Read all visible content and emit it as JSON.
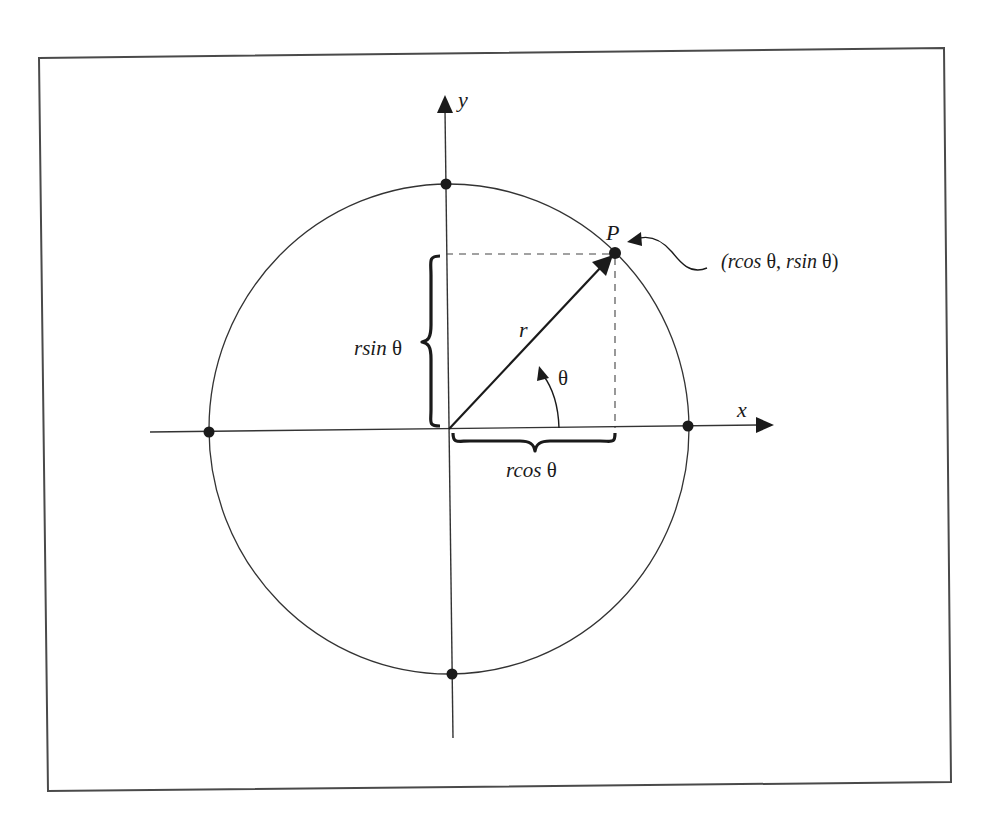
{
  "figure": {
    "type": "polar-coordinates-diagram",
    "axes": {
      "x_label": "x",
      "y_label": "y"
    },
    "circle": {
      "center": [
        449,
        429
      ],
      "rx": 240,
      "ry": 245,
      "axis_intercept_points": 4
    },
    "point": {
      "label": "P",
      "coordinates_label_parts": {
        "open": "(",
        "rcos": "rcos",
        "theta1": " θ, ",
        "rsin": "rsin",
        "theta2": " θ)"
      }
    },
    "radius_label": "r",
    "angle_label": "θ",
    "vertical_brace_label": {
      "var": "rsin",
      "theta": " θ"
    },
    "horizontal_brace_label": {
      "var": "rcos",
      "theta": " θ"
    }
  },
  "colors": {
    "ink": "#1a1a1a",
    "frame": "#4a4a4a",
    "background": "#ffffff"
  }
}
